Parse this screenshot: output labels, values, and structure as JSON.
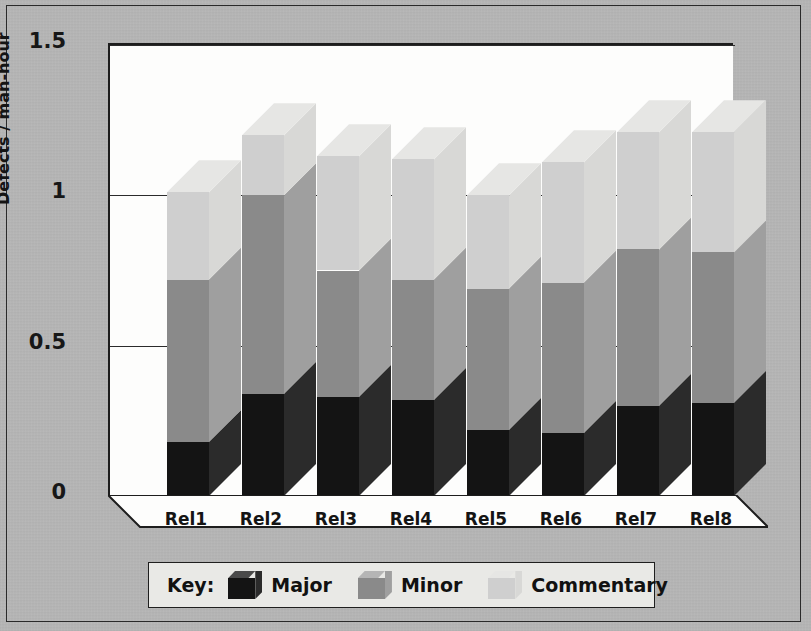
{
  "figure": {
    "y_axis_title": "Defects / man-hour",
    "legend_title": "Key:"
  },
  "chart_data": {
    "type": "bar",
    "stacked": true,
    "projection": "3d",
    "title": "",
    "xlabel": "",
    "ylabel": "Defects / man-hour",
    "ylim": [
      0,
      1.5
    ],
    "yticks": [
      "0",
      "0.5",
      "1",
      "1.5"
    ],
    "ytick_values": [
      0,
      0.5,
      1,
      1.5
    ],
    "grid": true,
    "legend_position": "bottom",
    "categories": [
      "Rel1",
      "Rel2",
      "Rel3",
      "Rel4",
      "Rel5",
      "Rel6",
      "Rel7",
      "Rel8"
    ],
    "series": [
      {
        "name": "Major",
        "color": "#141414",
        "top_color": "#4a4a4a",
        "side_color": "#2b2b2b",
        "values": [
          0.18,
          0.34,
          0.33,
          0.32,
          0.22,
          0.21,
          0.3,
          0.31
        ]
      },
      {
        "name": "Minor",
        "color": "#8a8a8a",
        "top_color": "#b5b5b5",
        "side_color": "#9f9f9f",
        "values": [
          0.54,
          0.66,
          0.42,
          0.4,
          0.47,
          0.5,
          0.52,
          0.5
        ]
      },
      {
        "name": "Commentary",
        "color": "#cfcfcf",
        "top_color": "#e6e6e4",
        "side_color": "#d8d8d6",
        "values": [
          0.29,
          0.2,
          0.38,
          0.4,
          0.31,
          0.4,
          0.39,
          0.4
        ]
      }
    ],
    "totals": [
      1.01,
      1.2,
      1.13,
      1.12,
      1.0,
      1.11,
      1.21,
      1.21
    ]
  }
}
